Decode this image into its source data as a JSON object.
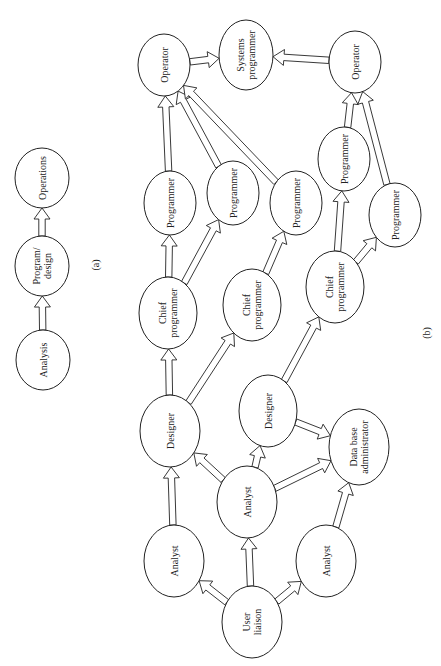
{
  "panel_a": {
    "label": "(a)",
    "label_pos": [
      97,
      265
    ],
    "nodes": [
      {
        "id": "a_analysis",
        "lines": [
          "Analysis"
        ],
        "cx": 43,
        "cy": 360,
        "rx": 27,
        "ry": 30
      },
      {
        "id": "a_program_design",
        "lines": [
          "Program/",
          "design"
        ],
        "cx": 42,
        "cy": 266,
        "rx": 27,
        "ry": 30
      },
      {
        "id": "a_operations",
        "lines": [
          "Operations"
        ],
        "cx": 42,
        "cy": 178,
        "rx": 27,
        "ry": 30
      }
    ],
    "edges": [
      {
        "from": "a_analysis",
        "to": "a_program_design"
      },
      {
        "from": "a_program_design",
        "to": "a_operations"
      }
    ]
  },
  "panel_b": {
    "label": "(b)",
    "label_pos": [
      428,
      333
    ],
    "nodes": [
      {
        "id": "op1",
        "lines": [
          "Operator"
        ],
        "cx": 164,
        "cy": 65,
        "rx": 26,
        "ry": 31
      },
      {
        "id": "sysprog",
        "lines": [
          "Systems",
          "programmer"
        ],
        "cx": 246,
        "cy": 55,
        "rx": 27,
        "ry": 35
      },
      {
        "id": "op2",
        "lines": [
          "Operator"
        ],
        "cx": 355,
        "cy": 62,
        "rx": 26,
        "ry": 31
      },
      {
        "id": "prog1",
        "lines": [
          "Programmer"
        ],
        "cx": 170,
        "cy": 203,
        "rx": 26,
        "ry": 32
      },
      {
        "id": "prog2",
        "lines": [
          "Programmer"
        ],
        "cx": 233,
        "cy": 193,
        "rx": 26,
        "ry": 32
      },
      {
        "id": "prog3",
        "lines": [
          "Programmer"
        ],
        "cx": 296,
        "cy": 203,
        "rx": 26,
        "ry": 32
      },
      {
        "id": "prog4",
        "lines": [
          "Programmer"
        ],
        "cx": 344,
        "cy": 159,
        "rx": 26,
        "ry": 32
      },
      {
        "id": "prog5",
        "lines": [
          "Programmer"
        ],
        "cx": 395,
        "cy": 215,
        "rx": 26,
        "ry": 32
      },
      {
        "id": "chief1",
        "lines": [
          "Chief",
          "programmer"
        ],
        "cx": 168,
        "cy": 313,
        "rx": 29,
        "ry": 36
      },
      {
        "id": "chief2",
        "lines": [
          "Chief",
          "programmer"
        ],
        "cx": 252,
        "cy": 305,
        "rx": 29,
        "ry": 36
      },
      {
        "id": "chief3",
        "lines": [
          "Chief",
          "programmer"
        ],
        "cx": 335,
        "cy": 287,
        "rx": 29,
        "ry": 36
      },
      {
        "id": "des1",
        "lines": [
          "Designer"
        ],
        "cx": 170,
        "cy": 431,
        "rx": 30,
        "ry": 36
      },
      {
        "id": "des2",
        "lines": [
          "Designer"
        ],
        "cx": 268,
        "cy": 411,
        "rx": 29,
        "ry": 36
      },
      {
        "id": "an1",
        "lines": [
          "Analyst"
        ],
        "cx": 174,
        "cy": 561,
        "rx": 30,
        "ry": 36
      },
      {
        "id": "an2",
        "lines": [
          "Analyst"
        ],
        "cx": 247,
        "cy": 502,
        "rx": 30,
        "ry": 36
      },
      {
        "id": "an3",
        "lines": [
          "Analyst"
        ],
        "cx": 326,
        "cy": 561,
        "rx": 30,
        "ry": 36
      },
      {
        "id": "dba",
        "lines": [
          "Data base",
          "administrator"
        ],
        "cx": 359,
        "cy": 447,
        "rx": 30,
        "ry": 38
      },
      {
        "id": "ul",
        "lines": [
          "User",
          "liaison"
        ],
        "cx": 252,
        "cy": 622,
        "rx": 30,
        "ry": 36
      }
    ],
    "edges": [
      {
        "from": "ul",
        "to": "an1"
      },
      {
        "from": "ul",
        "to": "an2"
      },
      {
        "from": "ul",
        "to": "an3"
      },
      {
        "from": "an1",
        "to": "des1"
      },
      {
        "from": "an2",
        "to": "des1"
      },
      {
        "from": "an2",
        "to": "des2"
      },
      {
        "from": "an2",
        "to": "dba"
      },
      {
        "from": "an3",
        "to": "dba"
      },
      {
        "from": "des2",
        "to": "dba"
      },
      {
        "from": "des1",
        "to": "chief1"
      },
      {
        "from": "des1",
        "to": "chief2"
      },
      {
        "from": "des2",
        "to": "chief3"
      },
      {
        "from": "chief1",
        "to": "prog1"
      },
      {
        "from": "chief1",
        "to": "prog2"
      },
      {
        "from": "chief2",
        "to": "prog3"
      },
      {
        "from": "chief3",
        "to": "prog4"
      },
      {
        "from": "chief3",
        "to": "prog5"
      },
      {
        "from": "prog1",
        "to": "op1"
      },
      {
        "from": "prog2",
        "to": "op1"
      },
      {
        "from": "prog3",
        "to": "op1"
      },
      {
        "from": "prog4",
        "to": "op2"
      },
      {
        "from": "prog5",
        "to": "op2"
      },
      {
        "from": "op1",
        "to": "sysprog"
      },
      {
        "from": "op2",
        "to": "sysprog"
      }
    ]
  },
  "style": {
    "stroke": "#222222",
    "fill": "#ffffff",
    "text_rotation_deg": -90
  }
}
